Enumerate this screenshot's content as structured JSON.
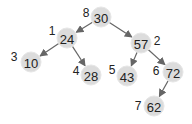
{
  "tree": {
    "nodes": [
      {
        "id": "n30",
        "value": "30",
        "order": "8",
        "x": 101,
        "y": 17,
        "lx": 86,
        "ly": 13
      },
      {
        "id": "n24",
        "value": "24",
        "order": "1",
        "x": 67,
        "y": 38,
        "lx": 52,
        "ly": 31
      },
      {
        "id": "n57",
        "value": "57",
        "order": "2",
        "x": 141,
        "y": 43,
        "lx": 157,
        "ly": 41
      },
      {
        "id": "n10",
        "value": "10",
        "order": "3",
        "x": 31,
        "y": 62,
        "lx": 14,
        "ly": 57
      },
      {
        "id": "n28",
        "value": "28",
        "order": "4",
        "x": 91,
        "y": 75,
        "lx": 76,
        "ly": 71
      },
      {
        "id": "n43",
        "value": "43",
        "order": "5",
        "x": 127,
        "y": 76,
        "lx": 112,
        "ly": 70
      },
      {
        "id": "n72",
        "value": "72",
        "order": "6",
        "x": 173,
        "y": 72,
        "lx": 156,
        "ly": 71
      },
      {
        "id": "n62",
        "value": "62",
        "order": "7",
        "x": 154,
        "y": 106,
        "lx": 138,
        "ly": 106
      }
    ],
    "edges": [
      {
        "from": "n30",
        "to": "n24"
      },
      {
        "from": "n30",
        "to": "n57"
      },
      {
        "from": "n24",
        "to": "n10"
      },
      {
        "from": "n24",
        "to": "n28"
      },
      {
        "from": "n57",
        "to": "n43"
      },
      {
        "from": "n57",
        "to": "n72"
      },
      {
        "from": "n72",
        "to": "n62"
      }
    ]
  }
}
